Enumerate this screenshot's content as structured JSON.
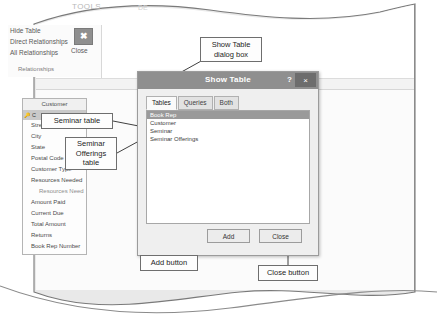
{
  "ribbon": {
    "tab_label": "TOOLS",
    "tab_label_faint": "DE",
    "items": [
      {
        "label": "Hide Table"
      },
      {
        "label": "Direct Relationships"
      },
      {
        "label": "All Relationships"
      }
    ],
    "group_label": "Relationships",
    "close_button": {
      "label": "Close",
      "glyph": "✖"
    }
  },
  "field_list": {
    "title": "Customer",
    "key_field": "C",
    "fields": [
      {
        "label": "C",
        "indent": false
      },
      {
        "label": "Street",
        "indent": false
      },
      {
        "label": "City",
        "indent": false
      },
      {
        "label": "State",
        "indent": false
      },
      {
        "label": "Postal Code",
        "indent": false
      },
      {
        "label": "Customer Type",
        "indent": false
      },
      {
        "label": "Resources Needed",
        "indent": false
      },
      {
        "label": "Resources Need",
        "indent": true
      },
      {
        "label": "Amount Paid",
        "indent": false
      },
      {
        "label": "Current Due",
        "indent": false
      },
      {
        "label": "Total Amount",
        "indent": false
      },
      {
        "label": "Returns",
        "indent": false
      },
      {
        "label": "Book Rep Number",
        "indent": false
      }
    ]
  },
  "dialog": {
    "title": "Show Table",
    "help_glyph": "?",
    "close_glyph": "×",
    "tabs": [
      {
        "label": "Tables",
        "active": true
      },
      {
        "label": "Queries",
        "active": false
      },
      {
        "label": "Both",
        "active": false
      }
    ],
    "list_items": [
      {
        "label": "Book Rep",
        "selected": true
      },
      {
        "label": "Customer",
        "selected": false
      },
      {
        "label": "Seminar",
        "selected": false
      },
      {
        "label": "Seminar Offerings",
        "selected": false
      }
    ],
    "buttons": {
      "add": "Add",
      "close": "Close"
    }
  },
  "callouts": {
    "show_table_dialog": "Show Table\ndialog box",
    "seminar_table": "Seminar table",
    "seminar_offerings_table": "Seminar\nOfferings\ntable",
    "add_button": "Add button",
    "close_button": "Close button"
  },
  "colors": {
    "paper": "#e9e9e9",
    "dialog_titlebar": "#8f8f8f",
    "selection": "#9a9a9a",
    "callout_border": "#6e6e6e"
  }
}
